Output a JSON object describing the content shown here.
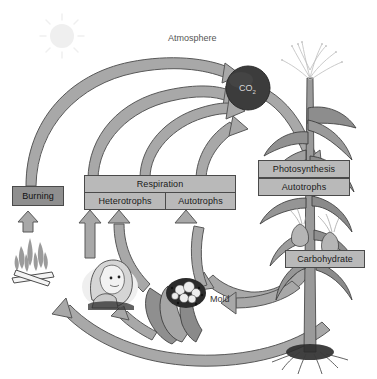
{
  "diagram": {
    "background_color": "#ffffff",
    "width": 377,
    "height": 379
  },
  "labels": {
    "atmosphere": "Atmosphere",
    "co2": "CO",
    "co2_subscript": "2",
    "mold": "Mold"
  },
  "boxes": [
    {
      "id": "burning",
      "label": "Burning",
      "style": "dark"
    },
    {
      "id": "respiration",
      "label": "Respiration",
      "style": "light"
    },
    {
      "id": "heterotrophs",
      "label": "Heterotrophs",
      "style": "light"
    },
    {
      "id": "autotrophs_resp",
      "label": "Autotrophs",
      "style": "light"
    },
    {
      "id": "photosynthesis",
      "label": "Photosynthesis",
      "style": "light"
    },
    {
      "id": "autotrophs_photo",
      "label": "Autotrophs",
      "style": "light"
    },
    {
      "id": "carbohydrate",
      "label": "Carbohydrate",
      "style": "light"
    }
  ],
  "illustrations": [
    {
      "id": "sun",
      "name": "sun"
    },
    {
      "id": "campfire",
      "name": "campfire-flames-and-logs"
    },
    {
      "id": "girl",
      "name": "girl-heterotroph-portrait"
    },
    {
      "id": "mold",
      "name": "mold-fungus-on-decaying-matter"
    },
    {
      "id": "corn",
      "name": "corn-plant-autotroph"
    }
  ],
  "flows": [
    {
      "id": "burning-to-co2",
      "from": "Burning",
      "to": "CO2"
    },
    {
      "id": "heterotrophs-to-co2",
      "from": "Heterotrophs",
      "to": "CO2"
    },
    {
      "id": "respiration-mid-to-co2",
      "from": "Respiration",
      "to": "CO2"
    },
    {
      "id": "autotrophs-to-co2",
      "from": "Autotrophs",
      "to": "CO2"
    },
    {
      "id": "co2-to-photosynthesis",
      "from": "CO2",
      "to": "Photosynthesis"
    },
    {
      "id": "carbohydrate-to-autotrophs",
      "from": "Carbohydrate",
      "to": "Autotrophs"
    },
    {
      "id": "carbohydrate-to-mold",
      "from": "Carbohydrate",
      "to": "Mold"
    },
    {
      "id": "carbohydrate-to-burning",
      "from": "Carbohydrate",
      "to": "Burning"
    },
    {
      "id": "fire-to-burning",
      "from": "Campfire",
      "to": "Burning"
    },
    {
      "id": "girl-to-heterotrophs",
      "from": "Girl",
      "to": "Heterotrophs"
    },
    {
      "id": "mold-to-heterotrophs",
      "from": "Mold",
      "to": "Heterotrophs"
    }
  ],
  "colors": {
    "arrow_fill": "#a8a8a8",
    "arrow_stroke": "#555555",
    "box_fill": "#b9b9b9",
    "box_fill_dark": "#8f8f8f",
    "box_stroke": "#4a4a4a",
    "co2_circle": "#3c3c3c",
    "sun": "#e8e8e8",
    "text": "#1a1a1a",
    "background": "#ffffff"
  }
}
